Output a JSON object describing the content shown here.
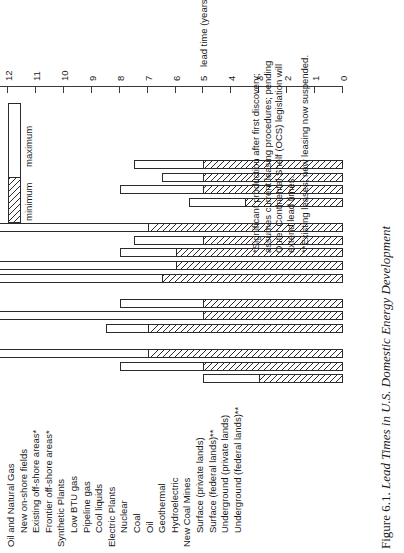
{
  "figure": {
    "number": "Figure 6.1.",
    "title": "Lead Times in U.S. Domestic Energy Development"
  },
  "axis": {
    "label": "lead time (years)",
    "ticks": [
      "0",
      "1",
      "2",
      "3",
      "4",
      "5",
      "6",
      "7",
      "8",
      "9",
      "10",
      "11",
      "12"
    ],
    "min": 0,
    "max": 12
  },
  "legend": {
    "minimum_label": "minimum",
    "maximum_label": "maximum"
  },
  "notes": [
    "*Significant production after first discovery; assumes current leasing procedures; pending Outer Continental Shelf (OCS) legislation will extend lead times.",
    "**Existing leases; new leasing now suspended."
  ],
  "chart_data": {
    "type": "bar",
    "title": "Lead Times in U.S. Domestic Energy Development",
    "xlabel": "lead time (years)",
    "ylabel": "",
    "xlim": [
      0,
      12
    ],
    "grid": false,
    "legend_position": "top-right",
    "orientation": "horizontal",
    "series": [
      {
        "name": "minimum"
      },
      {
        "name": "maximum"
      }
    ],
    "groups": [
      {
        "group": "Oil and Natural Gas",
        "items": [
          {
            "category": "New on-shore fields",
            "minimum": 3.0,
            "maximum": 5.0
          },
          {
            "category": "Existing off-shore areas*",
            "minimum": 5.0,
            "maximum": 8.0
          },
          {
            "category": "Frontier off-shore areas*",
            "minimum": 7.0,
            "maximum": 13.0
          }
        ]
      },
      {
        "group": "Synthetic Plants",
        "items": [
          {
            "category": "Low BTU gas",
            "minimum": 7.0,
            "maximum": 8.5
          },
          {
            "category": "Pipeline gas",
            "minimum": 5.0,
            "maximum": 13.0
          },
          {
            "category": "Cool liquids",
            "minimum": 5.0,
            "maximum": 8.0
          }
        ]
      },
      {
        "group": "Electric Plants",
        "items": [
          {
            "category": "Nuclear",
            "minimum": 6.5,
            "maximum": 13.0
          },
          {
            "category": "Coal",
            "minimum": 6.0,
            "maximum": 13.0
          },
          {
            "category": "Oil",
            "minimum": 6.0,
            "maximum": 8.0
          },
          {
            "category": "Geothermal",
            "minimum": 5.0,
            "maximum": 7.5
          },
          {
            "category": "Hydroelectric",
            "minimum": 7.0,
            "maximum": 13.0
          }
        ]
      },
      {
        "group": "New Coal Mines",
        "items": [
          {
            "category": "Surface (private lands)",
            "minimum": 3.5,
            "maximum": 5.5
          },
          {
            "category": "Surface (federal lands)**",
            "minimum": 5.0,
            "maximum": 8.0
          },
          {
            "category": "Underground (private lands)",
            "minimum": 5.0,
            "maximum": 6.5
          },
          {
            "category": "Underground (federal lands)**",
            "minimum": 5.0,
            "maximum": 7.5
          }
        ]
      }
    ]
  }
}
